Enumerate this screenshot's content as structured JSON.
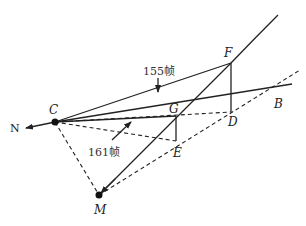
{
  "diagram": {
    "points": {
      "C": {
        "label": "C",
        "x": 55,
        "y": 122
      },
      "F": {
        "label": "F",
        "x": 231,
        "y": 63
      },
      "G": {
        "label": "G",
        "x": 176,
        "y": 116
      },
      "D": {
        "label": "D",
        "x": 231,
        "y": 112
      },
      "B": {
        "label": "B",
        "x": 274,
        "y": 94
      },
      "E": {
        "label": "E",
        "x": 176,
        "y": 141
      },
      "M": {
        "label": "M",
        "x": 99,
        "y": 195
      }
    },
    "direction_label": "N",
    "annotations": {
      "frame_155": "155帧",
      "frame_161": "161帧"
    },
    "colors": {
      "line": "#222222",
      "background": "#ffffff"
    }
  }
}
